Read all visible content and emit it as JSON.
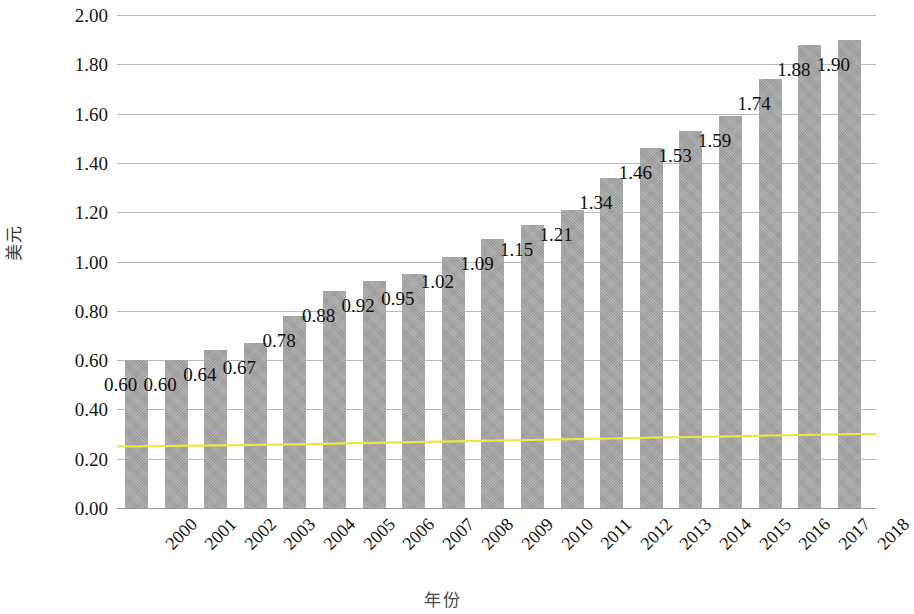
{
  "chart_data": {
    "type": "bar",
    "title": "",
    "xlabel": "年份",
    "ylabel": "美元",
    "categories": [
      "2000",
      "2001",
      "2002",
      "2003",
      "2004",
      "2005",
      "2006",
      "2007",
      "2008",
      "2009",
      "2010",
      "2011",
      "2012",
      "2013",
      "2014",
      "2015",
      "2016",
      "2017",
      "2018"
    ],
    "values": [
      0.6,
      0.6,
      0.64,
      0.67,
      0.78,
      0.88,
      0.92,
      0.95,
      1.02,
      1.09,
      1.15,
      1.21,
      1.34,
      1.46,
      1.53,
      1.59,
      1.74,
      1.88,
      1.9
    ],
    "value_labels": [
      "0.60",
      "0.60",
      "0.64",
      "0.67",
      "0.78",
      "0.88",
      "0.92",
      "0.95",
      "1.02",
      "1.09",
      "1.15",
      "1.21",
      "1.34",
      "1.46",
      "1.53",
      "1.59",
      "1.74",
      "1.88",
      "1.90"
    ],
    "ylim": [
      0,
      2.0
    ],
    "ytick_labels": [
      "2.00",
      "1.80",
      "1.60",
      "1.40",
      "1.20",
      "1.00",
      "0.80",
      "0.60",
      "0.40",
      "0.20",
      "0.00"
    ],
    "ytick_values": [
      2.0,
      1.8,
      1.6,
      1.4,
      1.2,
      1.0,
      0.8,
      0.6,
      0.4,
      0.2,
      0.0
    ],
    "grid": true,
    "legend": "none",
    "series": [
      {
        "name": "bars",
        "type": "bar",
        "color": "#a6a6a6",
        "values": [
          0.6,
          0.6,
          0.64,
          0.67,
          0.78,
          0.88,
          0.92,
          0.95,
          1.02,
          1.09,
          1.15,
          1.21,
          1.34,
          1.46,
          1.53,
          1.59,
          1.74,
          1.88,
          1.9
        ]
      },
      {
        "name": "reference-line",
        "type": "line",
        "color": "#e8e84a",
        "values": [
          0.25,
          0.252,
          0.254,
          0.256,
          0.258,
          0.261,
          0.264,
          0.267,
          0.27,
          0.273,
          0.276,
          0.279,
          0.282,
          0.285,
          0.288,
          0.291,
          0.294,
          0.297,
          0.3
        ]
      }
    ]
  },
  "axes": {
    "y_title": "美元",
    "x_title": "年份"
  },
  "colors": {
    "bar": "#a6a6a6",
    "line": "#e8e84a",
    "gridline": "#b9b9b9",
    "text": "#111111"
  }
}
